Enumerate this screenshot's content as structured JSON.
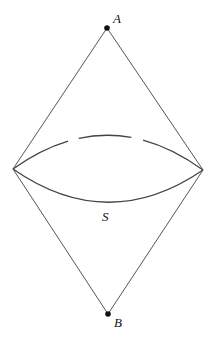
{
  "diagram": {
    "type": "causal-diamond",
    "points": {
      "A": {
        "label": "A",
        "x": 107,
        "y": 28
      },
      "B": {
        "label": "B",
        "x": 108,
        "y": 314
      },
      "left": {
        "x": 13,
        "y": 169
      },
      "right": {
        "x": 203,
        "y": 170
      }
    },
    "surface_label": "S",
    "edges": [
      {
        "from": "A",
        "to": "left"
      },
      {
        "from": "A",
        "to": "right"
      },
      {
        "from": "B",
        "to": "left"
      },
      {
        "from": "B",
        "to": "right"
      }
    ],
    "arcs": [
      {
        "name": "upper-arc",
        "style": "dashed",
        "apex_y": 135
      },
      {
        "name": "lower-arc",
        "style": "solid",
        "apex_y": 202
      }
    ],
    "colors": {
      "line": "#555555",
      "dot": "#111111",
      "background": "#ffffff"
    }
  }
}
